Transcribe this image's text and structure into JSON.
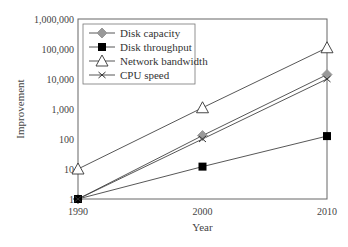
{
  "chart_data": {
    "type": "line",
    "title": "",
    "xlabel": "Year",
    "ylabel": "Improvement",
    "yscale": "log",
    "ylim": [
      1,
      1000000
    ],
    "x": [
      1990,
      2000,
      2010
    ],
    "x_tick_labels": [
      "1990",
      "2000",
      "2010"
    ],
    "y_tick_labels": [
      "1",
      "10",
      "100",
      "1,000",
      "10,000",
      "100,000",
      "1,000,000"
    ],
    "legend_position": "upper left",
    "grid": false,
    "series": [
      {
        "name": "Disk capacity",
        "marker": "diamond",
        "color": "#999999",
        "values": [
          1,
          130,
          14000
        ]
      },
      {
        "name": "Disk throughput",
        "marker": "square",
        "color": "#000000",
        "values": [
          1,
          12,
          125
        ]
      },
      {
        "name": "Network bandwidth",
        "marker": "triangle-open",
        "color": "#333333",
        "values": [
          10,
          1100,
          110000
        ]
      },
      {
        "name": "CPU speed",
        "marker": "x",
        "color": "#333333",
        "values": [
          1,
          100,
          10000
        ]
      }
    ]
  }
}
